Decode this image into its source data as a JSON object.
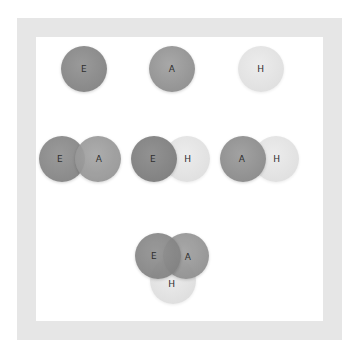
{
  "diagram": {
    "title": "",
    "colors": {
      "E": "#8e8e8e",
      "A": "#9b9b9b",
      "H": "#e3e3e3",
      "frame": "#e6e6e6",
      "label": "#2e2e2e"
    },
    "rows": [
      {
        "name": "singles",
        "groups": [
          {
            "sets": [
              "E"
            ],
            "label_E": "E"
          },
          {
            "sets": [
              "A"
            ],
            "label_A": "A"
          },
          {
            "sets": [
              "H"
            ],
            "label_H": "H"
          }
        ]
      },
      {
        "name": "pairs",
        "groups": [
          {
            "sets": [
              "E",
              "A"
            ],
            "label_E": "E",
            "label_A": "A"
          },
          {
            "sets": [
              "E",
              "H"
            ],
            "label_E": "E",
            "label_H": "H"
          },
          {
            "sets": [
              "A",
              "H"
            ],
            "label_A": "A",
            "label_H": "H"
          }
        ]
      },
      {
        "name": "triple",
        "groups": [
          {
            "sets": [
              "E",
              "A",
              "H"
            ],
            "label_E": "E",
            "label_A": "A",
            "label_H": "H"
          }
        ]
      }
    ]
  }
}
